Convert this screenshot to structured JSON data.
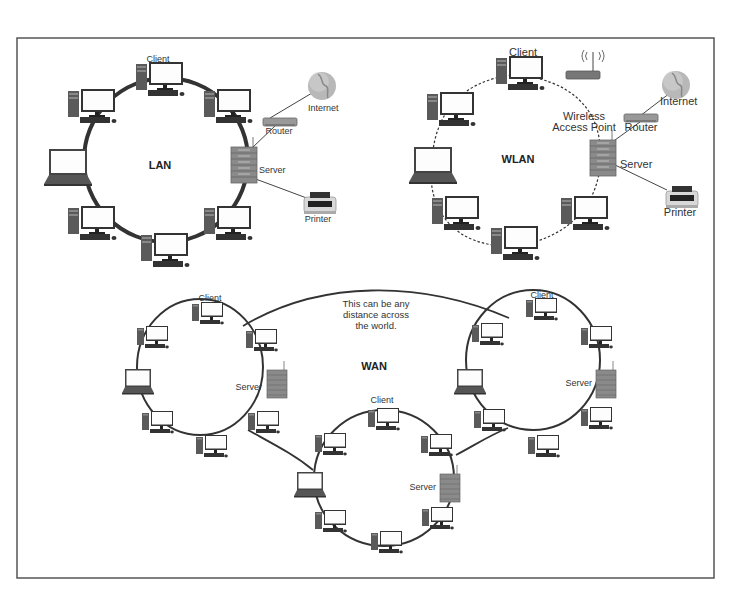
{
  "frame": {
    "border_color": "#555555",
    "background": "#ffffff"
  },
  "lan": {
    "title": "LAN",
    "labels": {
      "client": "Client",
      "server": "Server",
      "router": "Router",
      "internet": "Internet",
      "printer": "Printer"
    },
    "link_style": "solid"
  },
  "wlan": {
    "title": "WLAN",
    "labels": {
      "client": "Client",
      "server": "Server",
      "router": "Router",
      "internet": "Internet",
      "printer": "Printer",
      "wap_line1": "Wireless",
      "wap_line2": "Access Point"
    },
    "link_style": "dashed"
  },
  "wan": {
    "title": "WAN",
    "note_lines": [
      "This can be any",
      "distance across",
      "the world."
    ],
    "rings": [
      {
        "name": "left",
        "client_label": "Client",
        "server_label": "Server"
      },
      {
        "name": "right",
        "client_label": "Client",
        "server_label": "Server"
      },
      {
        "name": "bottom",
        "client_label": "Client",
        "server_label": "Server"
      }
    ]
  },
  "icons": [
    "desktop-computer-icon",
    "laptop-icon",
    "server-icon",
    "router-icon",
    "globe-icon",
    "printer-icon",
    "wireless-access-point-icon"
  ],
  "colors": {
    "link": "#333333",
    "server": "#8a8a8a",
    "screen": "#ffffff",
    "device": "#555555",
    "globe": "#b0b0b0"
  }
}
